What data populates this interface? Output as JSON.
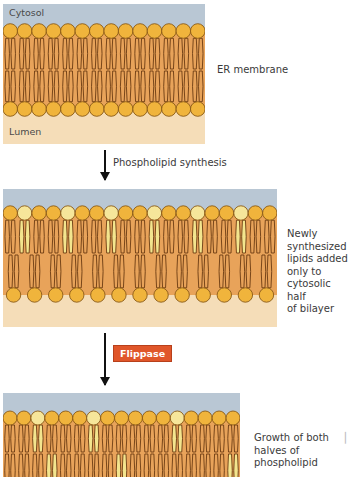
{
  "panels": [
    {
      "id": "er-membrane",
      "labels": {
        "top": "Cytosol",
        "bottom": "Lumen"
      },
      "side_text": "ER membrane",
      "top_heads": 14,
      "bottom_heads": 14,
      "new_top_indices": [],
      "new_bottom_tail_x": []
    },
    {
      "id": "newly-synthesized",
      "side_text_lines": [
        "Newly",
        "synthesized",
        "lipids added",
        "only to",
        "cytosolic half",
        "of bilayer"
      ],
      "top_heads": 19,
      "bottom_heads": 13,
      "new_top_indices": [
        1,
        4,
        7,
        10,
        13,
        16
      ]
    },
    {
      "id": "growth-both-halves",
      "side_text_lines": [
        "Growth of both",
        "halves of",
        "phospholipid"
      ],
      "top_heads": 17,
      "new_top_indices": [
        2,
        6,
        12
      ],
      "new_bottom_tail_x": [
        55,
        125,
        230
      ]
    }
  ],
  "steps": [
    {
      "label": "Phospholipid synthesis"
    },
    {
      "label": "Flippase",
      "badge": true
    }
  ],
  "colors": {
    "cytosol": "#b9c7d4",
    "lumen": "#f5ddb8",
    "core": "#e8a35a",
    "head": "#f0b43c",
    "head_new": "#f6e69a",
    "tail_stroke": "#6b3b12",
    "tail_new": "#f3e58e",
    "flippase": "#e0562a"
  }
}
